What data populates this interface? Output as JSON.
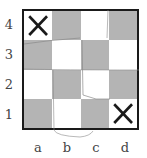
{
  "board": {
    "ranks": [
      "4",
      "3",
      "2",
      "1"
    ],
    "files": [
      "a",
      "b",
      "c",
      "d"
    ],
    "colors": {
      "dark": "#b4b4b4",
      "light": "#ffffff",
      "border": "#1a1a1a",
      "mark": "#1a1a1a",
      "sketch": "#8a8a8a"
    },
    "cells": [
      {
        "id": "a4",
        "shade": "white",
        "mark": "X"
      },
      {
        "id": "b4",
        "shade": "gray",
        "mark": ""
      },
      {
        "id": "c4",
        "shade": "white",
        "mark": ""
      },
      {
        "id": "d4",
        "shade": "gray",
        "mark": ""
      },
      {
        "id": "a3",
        "shade": "gray",
        "mark": ""
      },
      {
        "id": "b3",
        "shade": "white",
        "mark": ""
      },
      {
        "id": "c3",
        "shade": "gray",
        "mark": ""
      },
      {
        "id": "d3",
        "shade": "white",
        "mark": ""
      },
      {
        "id": "a2",
        "shade": "white",
        "mark": ""
      },
      {
        "id": "b2",
        "shade": "gray",
        "mark": ""
      },
      {
        "id": "c2",
        "shade": "white",
        "mark": ""
      },
      {
        "id": "d2",
        "shade": "gray",
        "mark": ""
      },
      {
        "id": "a1",
        "shade": "gray",
        "mark": ""
      },
      {
        "id": "b1",
        "shade": "white",
        "mark": ""
      },
      {
        "id": "c1",
        "shade": "gray",
        "mark": ""
      },
      {
        "id": "d1",
        "shade": "white",
        "mark": "X"
      }
    ]
  }
}
